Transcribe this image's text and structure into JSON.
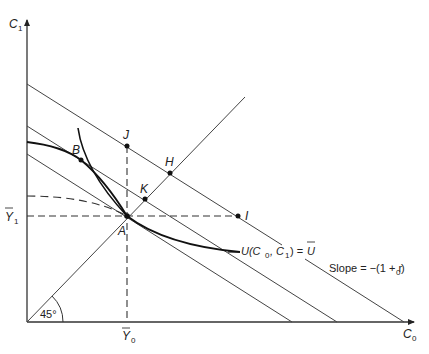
{
  "axes": {
    "y_label": "C",
    "y_label_sub": "1",
    "x_label": "C",
    "x_label_sub": "0",
    "y_tick_label": "Y",
    "y_tick_sub": "1",
    "x_tick_label": "Y",
    "x_tick_sub": "0",
    "angle_label": "45°"
  },
  "points": {
    "A": "A",
    "B": "B",
    "H": "H",
    "I": "I",
    "J": "J",
    "K": "K"
  },
  "curve_labels": {
    "utility_prefix": "U(C",
    "utility_sub0": "0",
    "utility_mid": ", C",
    "utility_sub1": "1",
    "utility_suffix": ") = ",
    "utility_ubar": "U",
    "slope_prefix": "Slope = −(1 + r",
    "slope_sub": "0",
    "slope_suffix": ")"
  },
  "colors": {
    "line": "#222222",
    "thin_line": "#444444"
  }
}
